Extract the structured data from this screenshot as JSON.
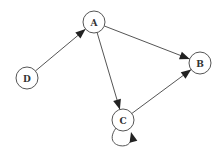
{
  "diagram": {
    "type": "directed-graph",
    "nodes": [
      {
        "id": "A",
        "label": "A"
      },
      {
        "id": "B",
        "label": "B"
      },
      {
        "id": "C",
        "label": "C"
      },
      {
        "id": "D",
        "label": "D"
      }
    ],
    "edges": [
      {
        "from": "D",
        "to": "A"
      },
      {
        "from": "A",
        "to": "B"
      },
      {
        "from": "A",
        "to": "C"
      },
      {
        "from": "C",
        "to": "B"
      },
      {
        "from": "C",
        "to": "C"
      }
    ],
    "colors": {
      "stroke": "#555555",
      "arrowhead": "#222222",
      "node_fill": "#ffffff",
      "label": "#333333"
    }
  }
}
